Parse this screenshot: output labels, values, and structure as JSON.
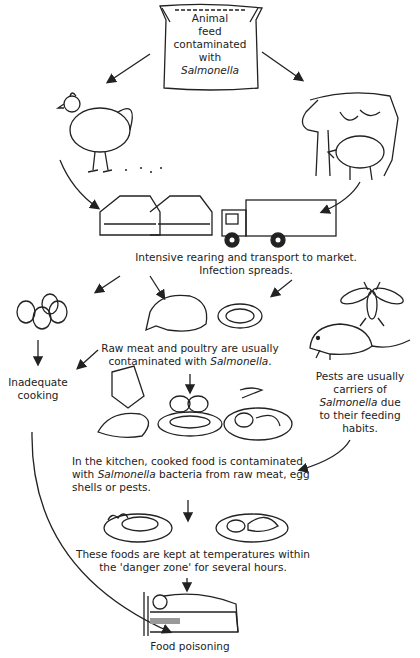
{
  "diagram": {
    "nodes": {
      "feed": {
        "line1": "Animal",
        "line2": "feed",
        "line3": "contaminated",
        "line4": "with",
        "line5": "Salmonella"
      },
      "rearing": {
        "line1": "Intensive rearing and transport to market.",
        "line2": "Infection spreads."
      },
      "raw_meat": {
        "line1": "Raw meat and poultry are usually",
        "line2a": "contaminated with ",
        "line2b": "Salmonella",
        "line2c": "."
      },
      "inadequate": {
        "line1": "Inadequate",
        "line2": "cooking"
      },
      "pests": {
        "line1": "Pests are usually",
        "line2": "carriers of",
        "line3a": "Salmonella",
        "line3b": " due",
        "line4": "to their feeding",
        "line5": "habits."
      },
      "kitchen": {
        "line1": "In the kitchen, cooked food is contaminated",
        "line2a": "with ",
        "line2b": "Salmonella",
        "line2c": " bacteria from raw meat, egg",
        "line3": "shells or pests."
      },
      "danger_zone": {
        "line1": "These foods are kept at temperatures within",
        "line2": "the 'danger zone' for several hours."
      },
      "poisoning": {
        "line1": "Food poisoning"
      }
    },
    "illustrations": [
      "feed-sack",
      "chicken",
      "cow-and-pig",
      "farm-buildings-truck",
      "eggs",
      "raw-meat",
      "fly",
      "rat",
      "glove-cloth",
      "meat-eggs-plate",
      "cooked-plate",
      "steak-plate",
      "chicken-plate",
      "sick-person-bed"
    ],
    "colors": {
      "line": "#222222",
      "background": "#ffffff"
    }
  }
}
